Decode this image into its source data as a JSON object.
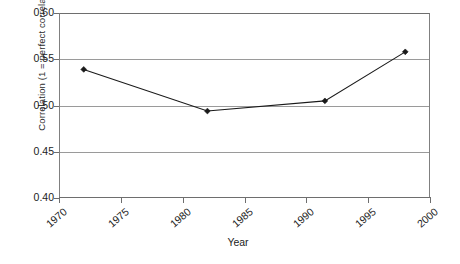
{
  "chart_data": {
    "type": "line",
    "title": "",
    "xlabel": "Year",
    "ylabel": "Correlation (1 = perfect correlation)",
    "xlim": [
      1970,
      2000
    ],
    "ylim": [
      0.4,
      0.6
    ],
    "xticks": [
      "1970",
      "1975",
      "1980",
      "1985",
      "1990",
      "1995",
      "2000"
    ],
    "yticks": [
      "0.60",
      "0.55",
      "0.50",
      "0.45",
      "0.40"
    ],
    "grid": "horizontal",
    "legend": "none",
    "marker": "diamond",
    "series": [
      {
        "name": "Correlation",
        "color": "#1a1a1a",
        "x": [
          1972,
          1982,
          1991.5,
          1998
        ],
        "values": [
          0.539,
          0.494,
          0.505,
          0.558
        ]
      }
    ]
  },
  "axis": {
    "y_title": "Correlation (1 = perfect correlation)",
    "x_title": "Year",
    "y_tick_labels": [
      "0.60",
      "0.55",
      "0.50",
      "0.45",
      "0.40"
    ],
    "x_tick_labels": [
      "1970",
      "1975",
      "1980",
      "1985",
      "1990",
      "1995",
      "2000"
    ]
  },
  "colors": {
    "series_line": "#1a1a1a",
    "gridline": "#9a9a9a",
    "frame": "#6e6e6e",
    "text": "#1c1c1c",
    "background": "#ffffff"
  }
}
